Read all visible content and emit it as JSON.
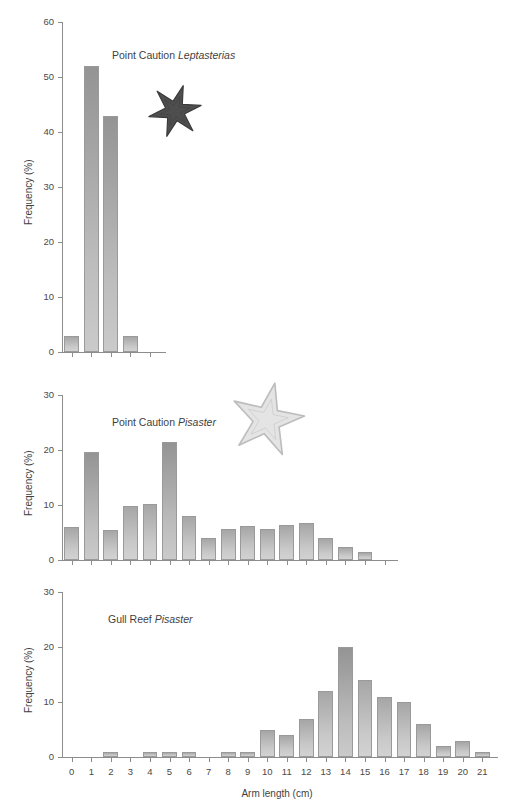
{
  "figure": {
    "axis_x_title": "Arm length (cm)",
    "axis_y_title": "Frequency (%)"
  },
  "panels": [
    {
      "id": "point-caution-leptasterias",
      "title_site": "Point Caution ",
      "title_species": "Leptasterias",
      "ylabel": "Frequency (%)",
      "ylim": [
        0,
        60
      ],
      "yticks": [
        "0",
        "10",
        "20",
        "30",
        "40",
        "50",
        "60"
      ],
      "starfish": {
        "name": "leptasterias-starfish-illustration",
        "arms": 6,
        "color": "#4b4b4b"
      }
    },
    {
      "id": "point-caution-pisaster",
      "title_site": "Point Caution ",
      "title_species": "Pisaster",
      "ylabel": "Frequency (%)",
      "ylim": [
        0,
        30
      ],
      "yticks": [
        "0",
        "10",
        "20",
        "30"
      ],
      "starfish": {
        "name": "pisaster-starfish-illustration",
        "arms": 5,
        "color": "#e2e2e2"
      }
    },
    {
      "id": "gull-reef-pisaster",
      "title_site": "Gull Reef ",
      "title_species": "Pisaster",
      "ylabel": "Frequency (%)",
      "ylim": [
        0,
        30
      ],
      "yticks": [
        "0",
        "10",
        "20",
        "30"
      ],
      "starfish": null
    }
  ],
  "xticks": [
    "0",
    "1",
    "2",
    "3",
    "4",
    "5",
    "6",
    "7",
    "8",
    "9",
    "10",
    "11",
    "12",
    "13",
    "14",
    "15",
    "16",
    "17",
    "18",
    "19",
    "20",
    "21"
  ],
  "chart_data": [
    {
      "type": "bar",
      "title": "Point Caution Leptasterias",
      "xlabel": "Arm length (cm)",
      "ylabel": "Frequency (%)",
      "ylim": [
        0,
        60
      ],
      "xlim": [
        -0.5,
        21.5
      ],
      "grid": false,
      "legend": "none",
      "categories": [
        0,
        1,
        2,
        3
      ],
      "values": [
        3,
        52,
        43,
        3
      ]
    },
    {
      "type": "bar",
      "title": "Point Caution Pisaster",
      "xlabel": "Arm length (cm)",
      "ylabel": "Frequency (%)",
      "ylim": [
        0,
        30
      ],
      "xlim": [
        -0.5,
        21.5
      ],
      "grid": false,
      "legend": "none",
      "categories": [
        0,
        1,
        2,
        3,
        4,
        5,
        6,
        7,
        8,
        9,
        10,
        11,
        12,
        13,
        14,
        15
      ],
      "values": [
        6,
        19.7,
        5.5,
        9.9,
        10.2,
        21.5,
        8,
        4,
        5.7,
        6.1,
        5.7,
        6.3,
        6.7,
        4,
        2.4,
        1.5
      ]
    },
    {
      "type": "bar",
      "title": "Gull Reef Pisaster",
      "xlabel": "Arm length (cm)",
      "ylabel": "Frequency (%)",
      "ylim": [
        0,
        30
      ],
      "xlim": [
        -0.5,
        21.5
      ],
      "grid": false,
      "legend": "none",
      "categories": [
        0,
        1,
        2,
        3,
        4,
        5,
        6,
        7,
        8,
        9,
        10,
        11,
        12,
        13,
        14,
        15,
        16,
        17,
        18,
        19,
        20,
        21
      ],
      "values": [
        0,
        0,
        1,
        0,
        1,
        1,
        1,
        0,
        1,
        1,
        5,
        4,
        7,
        12,
        20,
        14,
        11,
        10,
        6,
        2,
        3,
        1
      ]
    }
  ]
}
